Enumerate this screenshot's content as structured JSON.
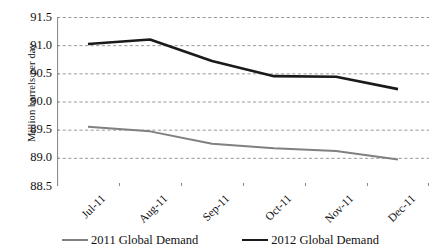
{
  "chart_data": {
    "type": "line",
    "title": "",
    "xlabel": "",
    "ylabel": "Million barrels per day",
    "categories": [
      "Jul-11",
      "Aug-11",
      "Sep-11",
      "Oct-11",
      "Nov-11",
      "Dec-11"
    ],
    "ylim": [
      88.5,
      91.5
    ],
    "yticks": [
      "91.5",
      "91.0",
      "90.5",
      "90.0",
      "89.5",
      "89.0",
      "88.5"
    ],
    "ytick_values": [
      91.5,
      91.0,
      90.5,
      90.0,
      89.5,
      89.0,
      88.5
    ],
    "grid": "horizontal-dashed",
    "legend_position": "bottom-center",
    "series": [
      {
        "name": "2011 Global Demand",
        "color": "#808080",
        "width": 2.0,
        "values": [
          89.55,
          89.47,
          89.25,
          89.17,
          89.12,
          88.97
        ]
      },
      {
        "name": "2012 Global Demand",
        "color": "#1a1a1a",
        "width": 2.6,
        "values": [
          91.02,
          91.1,
          90.72,
          90.45,
          90.44,
          90.22
        ]
      }
    ],
    "colors": {
      "axis": "#8c8c8c",
      "grid": "#9a9a9a",
      "series_2011": "#808080",
      "series_2012": "#1a1a1a",
      "background": "#ffffff"
    }
  }
}
